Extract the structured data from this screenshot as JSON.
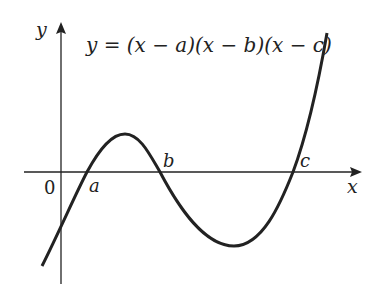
{
  "title": "y = (x − a)(x − b)(x − c)",
  "axes": {
    "x_label": "x",
    "y_label": "y",
    "origin_label": "0"
  },
  "roots": [
    {
      "label": "a"
    },
    {
      "label": "b"
    },
    {
      "label": "c"
    }
  ],
  "colors": {
    "stroke": "#222222",
    "background": "#ffffff"
  }
}
